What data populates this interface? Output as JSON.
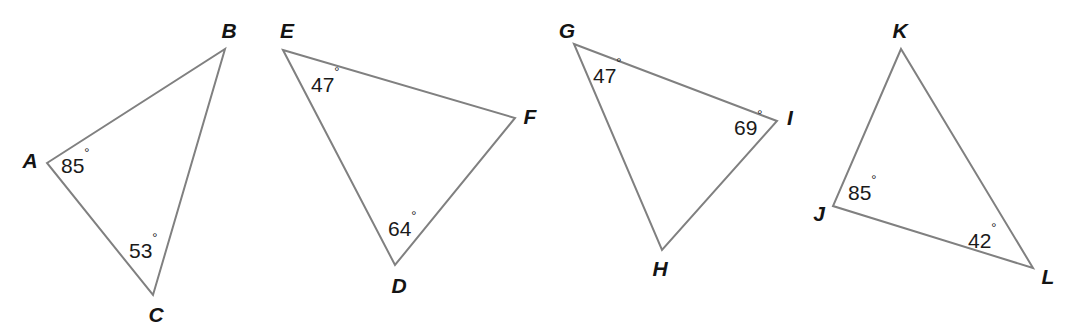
{
  "figure": {
    "name": "four-triangles-angle-diagram",
    "width": 1072,
    "height": 330,
    "background_color": "#ffffff",
    "stroke_color": "#808080",
    "stroke_width": 2,
    "label_color": "#141414",
    "angle_text_color": "#1a1a1a",
    "degree_symbol": "°"
  },
  "triangles": [
    {
      "id": "triangle-abc",
      "name": "ABC",
      "vertices": [
        {
          "label": "A",
          "x": 47,
          "y": 163,
          "label_x": 30,
          "label_y": 162,
          "anchor": "middle"
        },
        {
          "label": "B",
          "x": 225,
          "y": 49,
          "label_x": 229,
          "label_y": 32,
          "anchor": "middle"
        },
        {
          "label": "C",
          "x": 153,
          "y": 295,
          "label_x": 156,
          "label_y": 316,
          "anchor": "middle"
        }
      ],
      "angles": [
        {
          "at": "A",
          "value": "85",
          "text": "85°",
          "x": 61,
          "y": 167
        },
        {
          "at": "C",
          "value": "53",
          "text": "53°",
          "x": 129,
          "y": 252
        }
      ]
    },
    {
      "id": "triangle-def",
      "name": "DEF",
      "vertices": [
        {
          "label": "E",
          "x": 283,
          "y": 50,
          "label_x": 287,
          "label_y": 32,
          "anchor": "middle"
        },
        {
          "label": "F",
          "x": 515,
          "y": 118,
          "label_x": 530,
          "label_y": 118,
          "anchor": "middle"
        },
        {
          "label": "D",
          "x": 395,
          "y": 265,
          "label_x": 399,
          "label_y": 287,
          "anchor": "middle"
        }
      ],
      "angles": [
        {
          "at": "E",
          "value": "47",
          "text": "47°",
          "x": 311,
          "y": 86
        },
        {
          "at": "D",
          "value": "64",
          "text": "64°",
          "x": 388,
          "y": 230
        }
      ]
    },
    {
      "id": "triangle-ghi",
      "name": "GHI",
      "vertices": [
        {
          "label": "G",
          "x": 574,
          "y": 44,
          "label_x": 567,
          "label_y": 32,
          "anchor": "middle"
        },
        {
          "label": "I",
          "x": 777,
          "y": 121,
          "label_x": 790,
          "label_y": 119,
          "anchor": "middle"
        },
        {
          "label": "H",
          "x": 662,
          "y": 250,
          "label_x": 660,
          "label_y": 270,
          "anchor": "middle"
        }
      ],
      "angles": [
        {
          "at": "G",
          "value": "47",
          "text": "47°",
          "x": 593,
          "y": 77
        },
        {
          "at": "I",
          "value": "69",
          "text": "69°",
          "x": 734,
          "y": 129
        }
      ]
    },
    {
      "id": "triangle-jkl",
      "name": "JKL",
      "vertices": [
        {
          "label": "K",
          "x": 901,
          "y": 49,
          "label_x": 900,
          "label_y": 32,
          "anchor": "middle"
        },
        {
          "label": "J",
          "x": 833,
          "y": 206,
          "label_x": 819,
          "label_y": 215,
          "anchor": "middle"
        },
        {
          "label": "L",
          "x": 1033,
          "y": 268,
          "label_x": 1048,
          "label_y": 278,
          "anchor": "middle"
        }
      ],
      "angles": [
        {
          "at": "J",
          "value": "85",
          "text": "85°",
          "x": 848,
          "y": 194
        },
        {
          "at": "L",
          "value": "42",
          "text": "42°",
          "x": 968,
          "y": 242
        }
      ]
    }
  ]
}
